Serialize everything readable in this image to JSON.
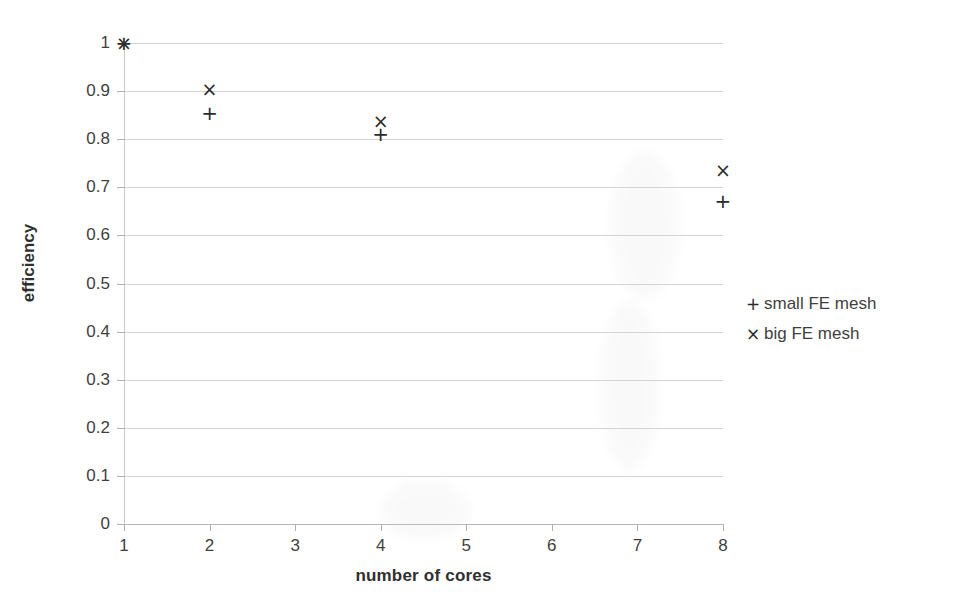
{
  "chart_data": {
    "type": "scatter",
    "title": "",
    "xlabel": "number of cores",
    "ylabel": "efficiency",
    "xlim": [
      1,
      8
    ],
    "ylim": [
      0,
      1
    ],
    "grid": true,
    "legend_position": "right",
    "x_ticks": [
      "1",
      "2",
      "3",
      "4",
      "5",
      "6",
      "7",
      "8"
    ],
    "y_ticks": [
      "1",
      "0.9",
      "0.8",
      "0.7",
      "0.6",
      "0.5",
      "0.4",
      "0.3",
      "0.2",
      "0.1",
      "0"
    ],
    "x_tick_values": [
      1,
      2,
      3,
      4,
      5,
      6,
      7,
      8
    ],
    "y_tick_values": [
      1,
      0.9,
      0.8,
      0.7,
      0.6,
      0.5,
      0.4,
      0.3,
      0.2,
      0.1,
      0
    ],
    "series": [
      {
        "name": "small FE mesh",
        "marker": "+",
        "color": "#2b2b2b",
        "x": [
          1,
          2,
          4,
          8
        ],
        "values": [
          1.0,
          0.855,
          0.81,
          0.672
        ]
      },
      {
        "name": "big FE mesh",
        "marker": "×",
        "color": "#2b2b2b",
        "x": [
          1,
          2,
          4,
          8
        ],
        "values": [
          1.0,
          0.905,
          0.838,
          0.735
        ]
      }
    ]
  },
  "legend": {
    "items": [
      {
        "marker": "+",
        "label": "small FE mesh"
      },
      {
        "marker": "×",
        "label": "big FE mesh"
      }
    ]
  },
  "axes": {
    "x_title": "number of cores",
    "y_title": "efficiency"
  }
}
